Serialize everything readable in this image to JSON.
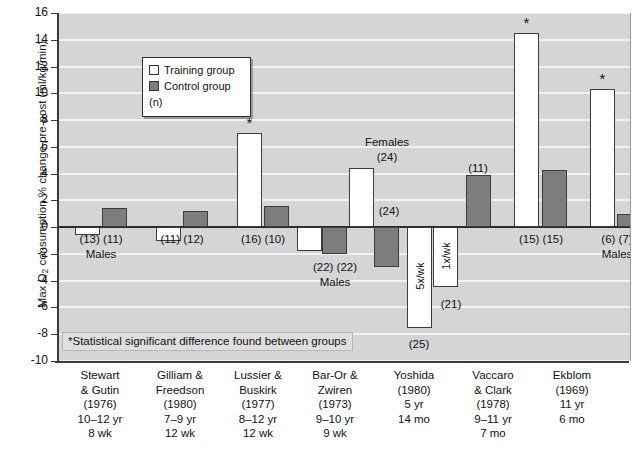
{
  "chart_data": {
    "type": "bar",
    "title": "",
    "xlabel": "",
    "ylabel": "Max O2 consumption % change pre-post (ml/kg/min)",
    "ylim": [
      -10,
      16
    ],
    "ytick_values": [
      16,
      14,
      12,
      10,
      8,
      6,
      4,
      2,
      0,
      -2,
      -4,
      -6,
      -8,
      -10
    ],
    "ytick_labels": [
      "16",
      "14",
      "12",
      "10",
      "8",
      "6",
      "4",
      "2",
      "0",
      "-2",
      "-4",
      "-6",
      "-8",
      "-10"
    ],
    "grid": true,
    "legend_position": "upper-left",
    "legend": [
      {
        "key": "training",
        "label": "Training group",
        "color": "#ffffff"
      },
      {
        "key": "control",
        "label": "Control group",
        "color": "#7d7d7d"
      },
      {
        "key": "n",
        "label": "(n)",
        "color": ""
      }
    ],
    "footnote": "*Statistical significant difference found between groups",
    "categories": [
      {
        "lines": [
          "Stewart",
          "& Gutin",
          "(1976)",
          "10–12 yr",
          "8 wk"
        ]
      },
      {
        "lines": [
          "Gilliam &",
          "Freedson",
          "(1980)",
          "7–9 yr",
          "12 wk"
        ]
      },
      {
        "lines": [
          "Lussier &",
          "Buskirk",
          "(1977)",
          "8–12 yr",
          "12 wk"
        ]
      },
      {
        "lines": [
          "Bar-Or &",
          "Zwiren",
          "(1973)",
          "9–10 yr",
          "9 wk"
        ]
      },
      {
        "lines": [
          "Yoshida",
          "(1980)",
          "5 yr",
          "14 mo"
        ]
      },
      {
        "lines": [
          "Vaccaro",
          "& Clark",
          "(1978)",
          "9–11 yr",
          "7 mo"
        ]
      },
      {
        "lines": [
          "Ekblom",
          "(1969)",
          "11 yr",
          "6 mo"
        ]
      }
    ],
    "bars": [
      {
        "group": 0,
        "series": "training",
        "value": -0.6,
        "n": "(13)",
        "star": false,
        "inner_label": ""
      },
      {
        "group": 0,
        "series": "control",
        "value": 1.4,
        "n": "(11)",
        "star": false,
        "inner_label": ""
      },
      {
        "group": 1,
        "series": "training",
        "value": -1.0,
        "n": "(11)",
        "star": false,
        "inner_label": ""
      },
      {
        "group": 1,
        "series": "control",
        "value": 1.2,
        "n": "(12)",
        "star": false,
        "inner_label": ""
      },
      {
        "group": 2,
        "series": "training",
        "value": 7.0,
        "n": "(16)",
        "star": true,
        "inner_label": ""
      },
      {
        "group": 2,
        "series": "control",
        "value": 1.6,
        "n": "(10)",
        "star": false,
        "inner_label": ""
      },
      {
        "group": 3,
        "series": "training",
        "value": -1.8,
        "n": "(22)",
        "star": false,
        "inner_label": ""
      },
      {
        "group": 3,
        "series": "control",
        "value": -2.0,
        "n": "(22)",
        "star": false,
        "inner_label": ""
      },
      {
        "group": 3,
        "series": "training",
        "value": 4.4,
        "n": "(24)",
        "star": false,
        "inner_label": ""
      },
      {
        "group": 3,
        "series": "control",
        "value": -3.0,
        "n": "(24)",
        "star": false,
        "inner_label": ""
      },
      {
        "group": 4,
        "series": "training",
        "value": -7.5,
        "n": "(25)",
        "star": false,
        "inner_label": "5x/wk"
      },
      {
        "group": 4,
        "series": "training",
        "value": -4.5,
        "n": "(21)",
        "star": false,
        "inner_label": "1x/wk"
      },
      {
        "group": 4,
        "series": "control",
        "value": 3.9,
        "n": "(11)",
        "star": false,
        "inner_label": ""
      },
      {
        "group": 5,
        "series": "training",
        "value": 14.5,
        "n": "(15)",
        "star": true,
        "inner_label": ""
      },
      {
        "group": 5,
        "series": "control",
        "value": 4.3,
        "n": "(15)",
        "star": false,
        "inner_label": ""
      },
      {
        "group": 6,
        "series": "training",
        "value": 10.3,
        "n": "(6)",
        "star": true,
        "inner_label": ""
      },
      {
        "group": 6,
        "series": "control",
        "value": 1.0,
        "n": "(7)",
        "star": false,
        "inner_label": ""
      }
    ],
    "annotations": [
      {
        "text": "Males",
        "group": 0
      },
      {
        "text": "Males",
        "group": 3
      },
      {
        "text": "Females",
        "group": 3
      },
      {
        "text": "Males",
        "group": 6
      }
    ],
    "n_labels_rendered": [
      {
        "text": "(13) (11)",
        "group": 0
      },
      {
        "text": "(11) (12)",
        "group": 1
      },
      {
        "text": "(16) (10)",
        "group": 2
      },
      {
        "text": "(22) (22)",
        "group": 3
      },
      {
        "text": "(24)",
        "group": 3
      },
      {
        "text": "(24)",
        "group": 3
      },
      {
        "text": "(25)",
        "group": 4
      },
      {
        "text": "(21)",
        "group": 4
      },
      {
        "text": "(11)",
        "group": 4
      },
      {
        "text": "(15) (15)",
        "group": 5
      },
      {
        "text": "(6) (7)",
        "group": 6
      }
    ]
  },
  "axis": {
    "ylabel_main": "Max O",
    "ylabel_sub": "2",
    "ylabel_rest": " consumption % change pre-post (ml/kg/min)"
  },
  "labels": {
    "males": "Males",
    "females": "Females",
    "n_13_11": "(13) (11)",
    "n_11_12": "(11) (12)",
    "n_16_10": "(16) (10)",
    "n_22_22": "(22) (22)",
    "n_24_top": "(24)",
    "n_24_ctrl": "(24)",
    "n_25": "(25)",
    "n_21": "(21)",
    "n_11_yosh": "(11)",
    "n_15_15": "(15) (15)",
    "n_6_7": "(6) (7)",
    "fivexwk": "5x/wk",
    "onexwk": "1x/wk",
    "star": "*"
  }
}
